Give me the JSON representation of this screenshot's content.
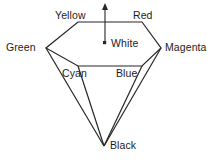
{
  "diagram": {
    "type": "hexcone-color-model",
    "stroke_color": "#262626",
    "background_color": "#ffffff",
    "text_color": "#1b1b1b",
    "labels": {
      "yellow": "Yellow",
      "red": "Red",
      "green": "Green",
      "magenta": "Magenta",
      "white": "White",
      "cyan": "Cyan",
      "blue": "Blue",
      "black": "Black"
    },
    "vertices": {
      "yellow": [
        78,
        22
      ],
      "red": [
        142,
        22
      ],
      "magenta": [
        161,
        48
      ],
      "blue": [
        142,
        66
      ],
      "cyan": [
        78,
        66
      ],
      "green": [
        46,
        48
      ],
      "white": [
        105,
        43
      ],
      "black": [
        104,
        146
      ],
      "axis_tip": [
        105,
        4
      ]
    },
    "markers": {
      "white_point": "dot-marker",
      "intensity_axis": "up-arrow"
    }
  }
}
